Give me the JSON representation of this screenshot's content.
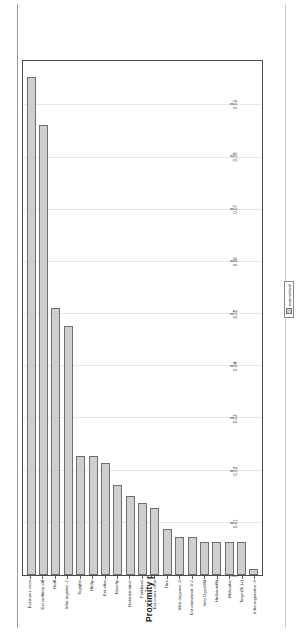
{
  "figure": {
    "title": "Proximity plot",
    "bar_fill_color": "#cfcfcf",
    "bar_border_color": "#6f6f6f",
    "grid_color": "#e6e6ee",
    "axis_color": "#4a4a4a"
  },
  "legend": {
    "label": "normalized",
    "swatch_name": "legend-swatch"
  },
  "chart_data": {
    "type": "bar",
    "title": "Proximity plot",
    "orientation": "horizontal",
    "xlabel": "",
    "ylabel": "",
    "xlim": [
      0,
      0.0985
    ],
    "grid": true,
    "legend_position": "bottom-right",
    "tick_labels": [
      "0",
      "0.01",
      "0.02",
      "0.03",
      "0.04",
      "0.05",
      "0.06",
      "0.07",
      "0.08",
      "0.09"
    ],
    "tick_values": [
      0,
      0.01,
      0.02,
      0.03,
      0.04,
      0.05,
      0.06,
      0.07,
      0.08,
      0.09
    ],
    "categories": [
      "Est max+ conv",
      "Est surftime diff",
      "Hdiff",
      "Infra register -2",
      "Tsgrijfm",
      "Hfdlip",
      "Est after",
      "Novelty",
      "Determination",
      "Forkbase",
      "Est conv+ conv",
      "Titre",
      "Infra dagvara -0",
      "Est dataverstr -0.2",
      "Velo OgscOM",
      "Hmbeutefftt",
      "Molvatter",
      "Target2k (+)",
      "Infra registerlor -0"
    ],
    "values": [
      0.0955,
      0.0862,
      0.0511,
      0.0477,
      0.0228,
      0.0228,
      0.0214,
      0.0172,
      0.0152,
      0.0138,
      0.0128,
      0.0089,
      0.0073,
      0.0073,
      0.0063,
      0.0063,
      0.0063,
      0.0063,
      0.0012
    ],
    "series": [
      {
        "name": "normalized",
        "values": [
          0.0955,
          0.0862,
          0.0511,
          0.0477,
          0.0228,
          0.0228,
          0.0214,
          0.0172,
          0.0152,
          0.0138,
          0.0128,
          0.0089,
          0.0073,
          0.0073,
          0.0063,
          0.0063,
          0.0063,
          0.0063,
          0.0012
        ]
      }
    ]
  }
}
